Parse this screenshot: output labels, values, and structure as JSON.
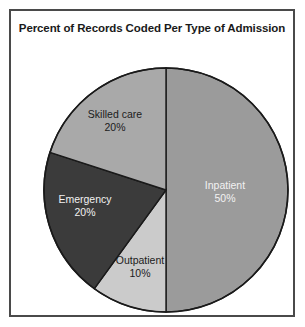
{
  "chart_data": {
    "type": "pie",
    "title": "Percent of Records Coded Per Type of Admission",
    "categories": [
      "Inpatient",
      "Outpatient",
      "Emergency",
      "Skilled care"
    ],
    "values": [
      50,
      10,
      20,
      20
    ],
    "value_labels": [
      "50%",
      "10%",
      "20%",
      "20%"
    ],
    "unit": "%",
    "total": 100,
    "legend": "none",
    "labels_position": "inside-slices",
    "start_angle_deg": 0,
    "direction": "clockwise",
    "slices": [
      {
        "name": "Inpatient",
        "value": 50,
        "value_label": "50%",
        "color": "#9b9b9b",
        "text_color": "#f2f2f2",
        "start_deg": 0,
        "end_deg": 180
      },
      {
        "name": "Outpatient",
        "value": 10,
        "value_label": "10%",
        "color": "#cbcbcb",
        "text_color": "#1c1c1c",
        "start_deg": 180,
        "end_deg": 216
      },
      {
        "name": "Emergency",
        "value": 20,
        "value_label": "20%",
        "color": "#3b3b3b",
        "text_color": "#f2f2f2",
        "start_deg": 216,
        "end_deg": 288
      },
      {
        "name": "Skilled care",
        "value": 20,
        "value_label": "20%",
        "color": "#a9a9a9",
        "text_color": "#1c1c1c",
        "start_deg": 288,
        "end_deg": 360
      }
    ]
  },
  "figure": {
    "border_color": "#4a4a4a",
    "background": "#ffffff",
    "outline_color": "#1a1a1a"
  }
}
